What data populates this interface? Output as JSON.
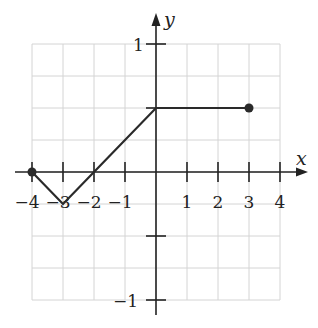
{
  "chart_data": {
    "type": "line",
    "title": "",
    "xlabel": "x",
    "ylabel": "y",
    "xlim": [
      -4,
      4
    ],
    "ylim": [
      -1,
      1
    ],
    "grid": true,
    "grid_step": {
      "x": 1,
      "y": 0.25
    },
    "x_tick_labels": [
      "-4",
      "-3",
      "-2",
      "-1",
      "1",
      "2",
      "3",
      "4"
    ],
    "x_ticks": [
      -4,
      -3,
      -2,
      -1,
      1,
      2,
      3,
      4
    ],
    "y_tick_labels": [
      "1",
      "-1"
    ],
    "y_ticks": [
      1,
      0.5,
      -0.5,
      -1
    ],
    "series": [
      {
        "name": "f",
        "points": [
          [
            -4,
            0
          ],
          [
            -3,
            -0.25
          ],
          [
            -2,
            0
          ],
          [
            0,
            0.5
          ],
          [
            3,
            0.5
          ]
        ],
        "endpoints": [
          {
            "x": -4,
            "y": 0,
            "style": "closed"
          },
          {
            "x": 3,
            "y": 0.5,
            "style": "closed"
          }
        ]
      }
    ],
    "colors": {
      "line": "#2a2a2a",
      "grid": "#d0d0d0",
      "axis": "#222222"
    }
  },
  "labels": {
    "x_axis": "x",
    "y_axis": "y",
    "x_ticks": [
      "−4",
      "−3",
      "−2",
      "−1",
      "1",
      "2",
      "3",
      "4"
    ],
    "y_top": "1",
    "y_bottom": "−1"
  }
}
